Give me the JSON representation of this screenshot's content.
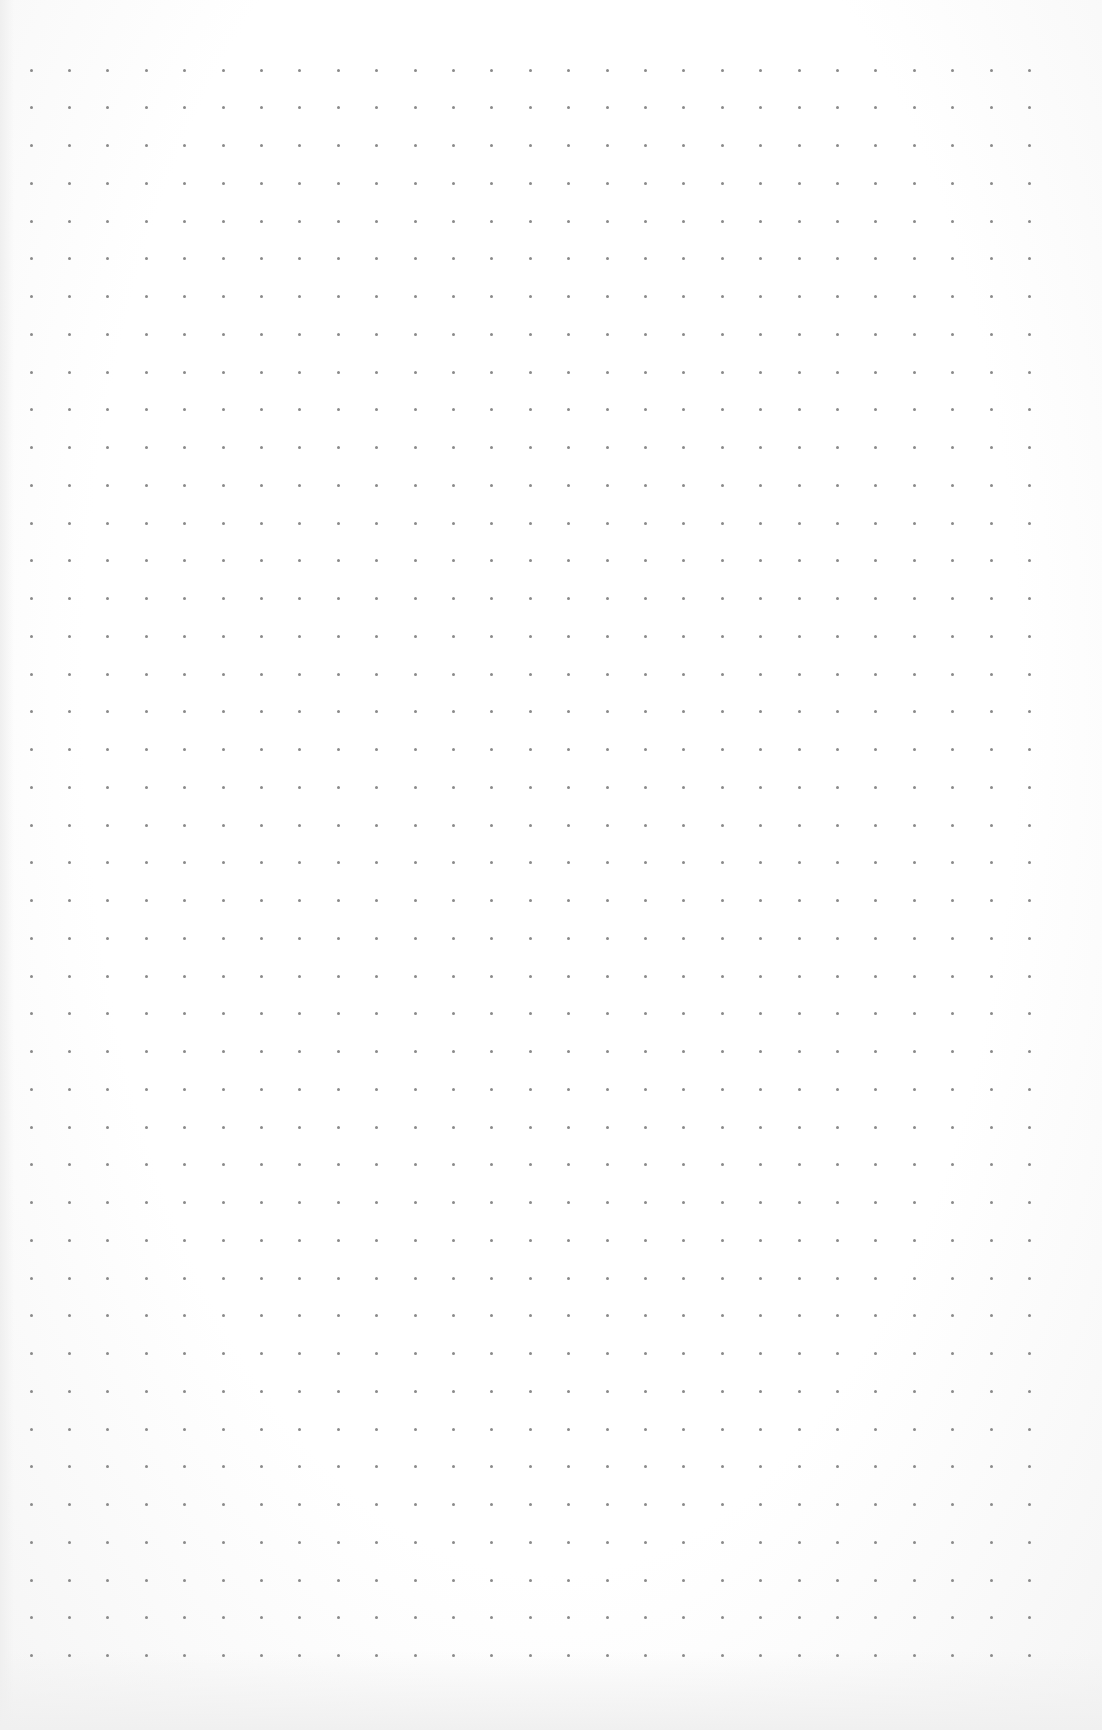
{
  "page": {
    "type": "dot-grid-paper",
    "background_color": "#fdfdfd"
  },
  "grid": {
    "columns": 27,
    "rows": 43,
    "origin_x": 31,
    "origin_y": 70,
    "spacing_x": 38.4,
    "spacing_y": 37.75,
    "dot_size": 3,
    "dot_color": "#8a8a8a"
  }
}
